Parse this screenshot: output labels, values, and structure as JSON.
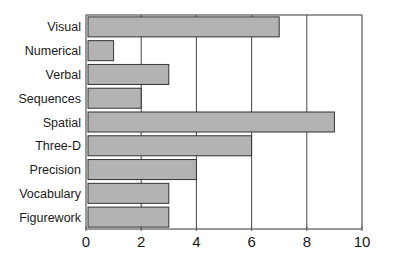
{
  "chart_data": {
    "type": "bar",
    "orientation": "horizontal",
    "title": "",
    "xlabel": "",
    "ylabel": "",
    "categories": [
      "Visual",
      "Numerical",
      "Verbal",
      "Sequences",
      "Spatial",
      "Three-D",
      "Precision",
      "Vocabulary",
      "Figurework"
    ],
    "values": [
      7,
      1,
      3,
      2,
      9,
      6,
      4,
      3,
      3
    ],
    "xlim": [
      0,
      10
    ],
    "xticks": [
      0,
      2,
      4,
      6,
      8,
      10
    ],
    "grid": "vertical",
    "legend": "none",
    "colors": {
      "bar_fill": "#b3b3b3",
      "bar_stroke": "#333333",
      "grid": "#444444",
      "axis": "#555555"
    }
  }
}
